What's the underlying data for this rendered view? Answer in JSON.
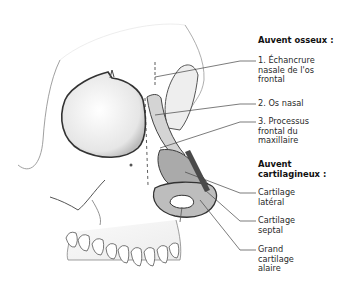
{
  "diagram": {
    "groups": [
      {
        "heading": "Auvent osseux :",
        "labels": [
          {
            "lines": [
              "1. Échancrure",
              "nasale de l'os",
              "frontal"
            ]
          },
          {
            "lines": [
              "2. Os nasal"
            ]
          },
          {
            "lines": [
              "3. Processus",
              "frontal du",
              "maxillaire"
            ]
          }
        ]
      },
      {
        "heading_lines": [
          "Auvent",
          "cartilagineux :"
        ],
        "labels": [
          {
            "lines": [
              "Cartilage",
              "latéral"
            ]
          },
          {
            "lines": [
              "Cartilage",
              "septal"
            ]
          },
          {
            "lines": [
              "Grand",
              "cartilage",
              "alaire"
            ]
          }
        ]
      }
    ],
    "colors": {
      "background": "#ffffff",
      "bone_outline": "#3a3a3a",
      "cartilage_fill": "#a8a8a8",
      "nasal_bone_fill": "#d4d4d4",
      "leader_line": "#444444"
    }
  }
}
